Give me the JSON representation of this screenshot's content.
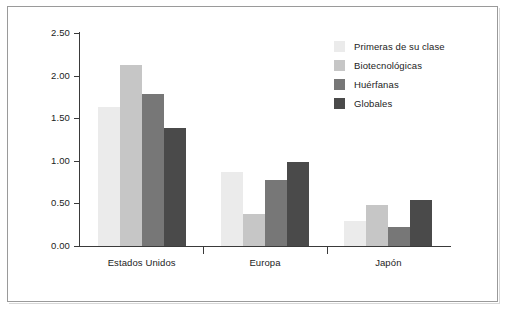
{
  "chart_data": {
    "type": "bar",
    "title": "",
    "subtitle": "",
    "xlabel": "",
    "ylabel": "",
    "categories": [
      "Estados Unidos",
      "Europa",
      "Japón"
    ],
    "series": [
      {
        "name": "Primeras de su clase",
        "color": "#ebebeb",
        "values": [
          1.63,
          0.87,
          0.29
        ]
      },
      {
        "name": "Biotecnológicas",
        "color": "#c6c6c6",
        "values": [
          2.13,
          0.38,
          0.48
        ]
      },
      {
        "name": "Huérfanas",
        "color": "#777777",
        "values": [
          1.79,
          0.77,
          0.22
        ]
      },
      {
        "name": "Globales",
        "color": "#4a4a4a",
        "values": [
          1.39,
          0.99,
          0.54
        ]
      }
    ],
    "ylim": [
      0.0,
      2.5
    ],
    "ytick_values": [
      0.0,
      0.5,
      1.0,
      1.5,
      2.0,
      2.5
    ],
    "ytick_labels": [
      "0.00",
      "0.50",
      "1.00",
      "1.50",
      "2.00",
      "2.50"
    ],
    "grid": false,
    "legend_position": "top-right",
    "axis_color": "#3a3a3a",
    "frame_color": "#9a9a9a",
    "background": "#ffffff"
  },
  "legend": {
    "items": [
      {
        "label": "Primeras de su clase",
        "color": "#ebebeb"
      },
      {
        "label": "Biotecnológicas",
        "color": "#c6c6c6"
      },
      {
        "label": "Huérfanas",
        "color": "#777777"
      },
      {
        "label": "Globales",
        "color": "#4a4a4a"
      }
    ]
  }
}
